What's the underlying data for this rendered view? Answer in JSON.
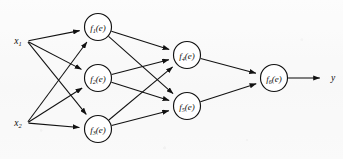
{
  "figure": {
    "background_color": "#fbfbfb",
    "ink_color": "#111111",
    "width": 343,
    "height": 159
  },
  "inputs": [
    {
      "id": "x1",
      "label": "x",
      "subscript": "1",
      "x": 18,
      "y": 41
    },
    {
      "id": "x2",
      "label": "x",
      "subscript": "2",
      "x": 18,
      "y": 123
    }
  ],
  "output": {
    "id": "y",
    "label": "y",
    "x": 333,
    "y": 78
  },
  "nodes": [
    {
      "id": "f1",
      "label": "f",
      "subscript": "1",
      "arg": "(e)",
      "cx": 98,
      "cy": 27,
      "r": 13.5,
      "layer": 1
    },
    {
      "id": "f2",
      "label": "f",
      "subscript": "2",
      "arg": "(e)",
      "cx": 98,
      "cy": 78,
      "r": 13.5,
      "layer": 1
    },
    {
      "id": "f3",
      "label": "f",
      "subscript": "3",
      "arg": "(e)",
      "cx": 98,
      "cy": 129,
      "r": 13.5,
      "layer": 1
    },
    {
      "id": "f4",
      "label": "f",
      "subscript": "4",
      "arg": "(e)",
      "cx": 187,
      "cy": 55,
      "r": 13.5,
      "layer": 2
    },
    {
      "id": "f5",
      "label": "f",
      "subscript": "5",
      "arg": "(e)",
      "cx": 187,
      "cy": 106,
      "r": 13.5,
      "layer": 2
    },
    {
      "id": "f6",
      "label": "f",
      "subscript": "6",
      "arg": "(e)",
      "cx": 274,
      "cy": 78,
      "r": 13.5,
      "layer": 3
    }
  ],
  "edges": [
    {
      "id": "x1-f1",
      "from": "x1",
      "to": "f1"
    },
    {
      "id": "x1-f2",
      "from": "x1",
      "to": "f2"
    },
    {
      "id": "x1-f3",
      "from": "x1",
      "to": "f3"
    },
    {
      "id": "x2-f1",
      "from": "x2",
      "to": "f1"
    },
    {
      "id": "x2-f2",
      "from": "x2",
      "to": "f2"
    },
    {
      "id": "x2-f3",
      "from": "x2",
      "to": "f3"
    },
    {
      "id": "f1-f4",
      "from": "f1",
      "to": "f4"
    },
    {
      "id": "f1-f5",
      "from": "f1",
      "to": "f5"
    },
    {
      "id": "f2-f4",
      "from": "f2",
      "to": "f4"
    },
    {
      "id": "f2-f5",
      "from": "f2",
      "to": "f5"
    },
    {
      "id": "f3-f4",
      "from": "f3",
      "to": "f4"
    },
    {
      "id": "f3-f5",
      "from": "f3",
      "to": "f5"
    },
    {
      "id": "f4-f6",
      "from": "f4",
      "to": "f6"
    },
    {
      "id": "f5-f6",
      "from": "f5",
      "to": "f6"
    },
    {
      "id": "f6-y",
      "from": "f6",
      "to": "y"
    }
  ]
}
